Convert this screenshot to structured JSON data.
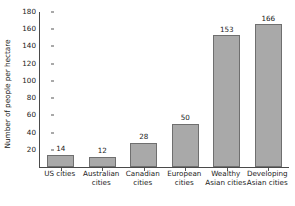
{
  "chart_data": {
    "type": "bar",
    "title": "",
    "xlabel": "",
    "ylabel": "Number of people per hectare",
    "categories": [
      "US cities",
      "Australian cities",
      "Canadian cities",
      "European cities",
      "Wealthy Asian cities",
      "Developing Asian cities"
    ],
    "category_lines": [
      [
        "US cities"
      ],
      [
        "Australian",
        "cities"
      ],
      [
        "Canadian",
        "cities"
      ],
      [
        "European",
        "cities"
      ],
      [
        "Wealthy",
        "Asian cities"
      ],
      [
        "Developing",
        "Asian cities"
      ]
    ],
    "values": [
      14,
      12,
      28,
      50,
      153,
      166
    ],
    "value_labels": [
      "14",
      "12",
      "28",
      "50",
      "153",
      "166"
    ],
    "ylim": [
      0,
      180
    ],
    "ytick_labels": [
      "180",
      "160",
      "140",
      "120",
      "100",
      "80",
      "60",
      "40",
      "20"
    ],
    "ytick_values": [
      180,
      160,
      140,
      120,
      100,
      80,
      60,
      40,
      20
    ],
    "grid": false,
    "legend": null,
    "bar_color": "#a9a9a9",
    "bar_border_color": "#6f6f6f",
    "axis_color": "#4a4a4a",
    "text_color": "#1a1a1a",
    "background_color": "#ffffff"
  }
}
